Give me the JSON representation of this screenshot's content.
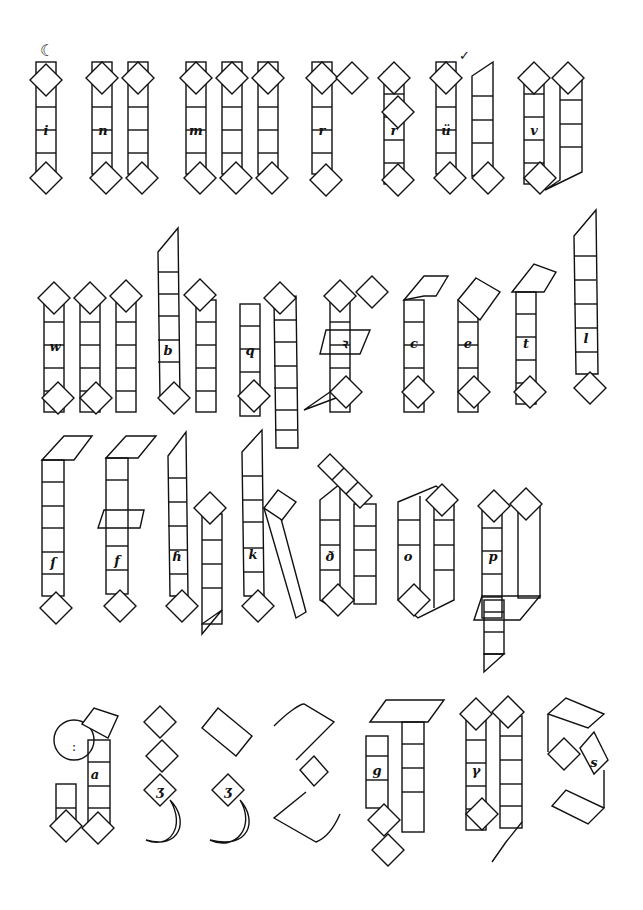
{
  "rows": [
    {
      "letters": [
        "i",
        "n",
        "m",
        "r",
        "r",
        "ü",
        "v"
      ]
    },
    {
      "letters": [
        "w",
        "b",
        "q",
        "ꝛ",
        "c",
        "e",
        "t",
        "l"
      ]
    },
    {
      "letters": [
        "ſ",
        "f",
        "h",
        "k",
        "d",
        "o",
        "p"
      ]
    },
    {
      "letters": [
        "a",
        "ʒ",
        "ʒ",
        "z",
        "g",
        "y",
        "s"
      ]
    }
  ],
  "labels": {
    "i": "i",
    "n": "n",
    "m": "m",
    "r1": "r",
    "r2": "r",
    "u": "ü",
    "v": "v",
    "w": "w",
    "b": "b",
    "q": "q",
    "rr": "ꝛ",
    "c": "c",
    "e": "e",
    "t": "t",
    "l": "l",
    "s_long": "ſ",
    "f": "f",
    "h": "ɦ",
    "k": "k",
    "d": "ð",
    "o": "o",
    "p": "p",
    "a": "a",
    "z1": "ʒ",
    "z2": "ʒ",
    "g": "g",
    "y": "γ",
    "s": "s"
  },
  "marks": {
    "i_dot": "☾",
    "u_mark": "✓",
    "a_colon": ":"
  },
  "colors": {
    "ink": "#111111",
    "paper": "#ffffff"
  }
}
